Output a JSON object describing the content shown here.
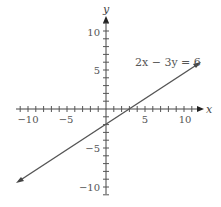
{
  "chart_data": {
    "type": "line",
    "title": "",
    "xlabel": "x",
    "ylabel": "y",
    "xlim": [
      -11.5,
      12
    ],
    "ylim": [
      -11,
      12
    ],
    "grid": false,
    "x_ticks": [
      -10,
      -5,
      5,
      10
    ],
    "y_ticks": [
      -10,
      -5,
      5,
      10
    ],
    "tick_labels": {
      "x": [
        "−10",
        "−5",
        "5",
        "10"
      ],
      "y": [
        "−10",
        "−5",
        "5",
        "10"
      ]
    },
    "series": [
      {
        "name": "2x − 3y = 6",
        "equation": "2x - 3y = 6",
        "slope": 0.6667,
        "y_intercept": -2,
        "x_intercept": 3,
        "x": [
          -11.3,
          12
        ],
        "y": [
          -9.53,
          6
        ]
      }
    ],
    "annotations": [
      {
        "text": "2x − 3y = 6",
        "x": 7.5,
        "y": 7
      }
    ],
    "line_color": "#555555"
  },
  "labels": {
    "x_axis": "x",
    "y_axis": "y",
    "equation": "2x − 3y = 6",
    "xt_m10": "−10",
    "xt_m5": "−5",
    "xt_5": "5",
    "xt_10": "10",
    "yt_10": "10",
    "yt_5": "5",
    "yt_m5": "−5",
    "yt_m10": "−10"
  }
}
